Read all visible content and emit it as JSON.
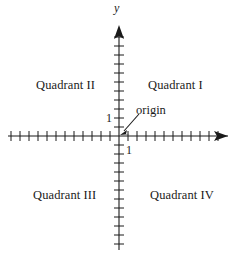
{
  "figure": {
    "kind": "cartesian-coordinate-plane-diagram",
    "width": 247,
    "height": 254,
    "background_color": "#ffffff",
    "ink_color": "#1a1a1a"
  },
  "axes": {
    "y_axis_name": "y",
    "x_axis_name": "",
    "origin_px": {
      "x": 119,
      "y": 136
    },
    "tick_spacing_px": 9,
    "x_ticks_left": 12,
    "x_ticks_right": 11,
    "y_ticks_up": 11,
    "y_ticks_down": 12,
    "arrowheads": {
      "x_right": true,
      "x_left": false,
      "y_top": true,
      "y_bottom": false
    }
  },
  "tick_labels": {
    "y_unit": "1",
    "x_unit": "1"
  },
  "annotation": {
    "origin_label": "origin",
    "arrow_from_px": {
      "x": 138,
      "y": 116
    },
    "arrow_to_px": {
      "x": 122,
      "y": 133
    }
  },
  "quadrants": [
    {
      "id": "quadrant-1",
      "label": "Quadrant I"
    },
    {
      "id": "quadrant-2",
      "label": "Quadrant II"
    },
    {
      "id": "quadrant-3",
      "label": "Quadrant III"
    },
    {
      "id": "quadrant-4",
      "label": "Quadrant IV"
    }
  ]
}
